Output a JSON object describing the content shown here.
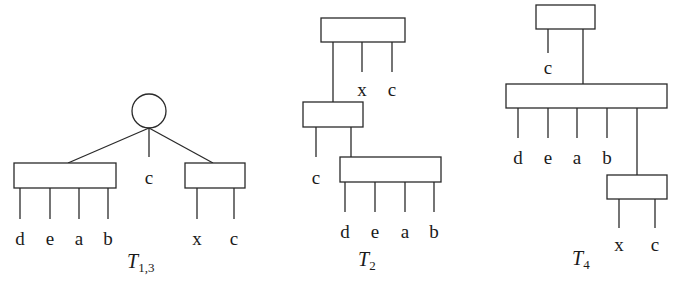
{
  "diagrams": {
    "t13": {
      "title_main": "T",
      "title_sub": "1,3",
      "root": "circle",
      "middle_leaf": "c",
      "left_leaves": [
        "d",
        "e",
        "a",
        "b"
      ],
      "right_leaves": [
        "x",
        "c"
      ]
    },
    "t2": {
      "title_main": "T",
      "title_sub": "2",
      "top_leaves": [
        "x",
        "c"
      ],
      "middle_leaf": "c",
      "bottom_leaves": [
        "d",
        "e",
        "a",
        "b"
      ]
    },
    "t4": {
      "title_main": "T",
      "title_sub": "4",
      "top_leaf": "c",
      "middle_leaves": [
        "d",
        "e",
        "a",
        "b"
      ],
      "bottom_leaves": [
        "x",
        "c"
      ]
    }
  },
  "colors": {
    "stroke": "#2a2a2a",
    "background": "#ffffff"
  }
}
